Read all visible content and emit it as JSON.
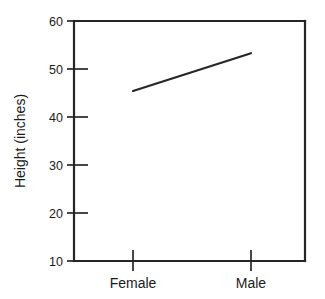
{
  "chart_data": {
    "type": "line",
    "title": "",
    "subtitle": "",
    "xlabel": "",
    "ylabel": "Height (inches)",
    "categories": [
      "Female",
      "Male"
    ],
    "series": [
      {
        "name": "Height",
        "values": [
          45.4,
          53.3
        ]
      }
    ],
    "ylim": [
      10,
      60
    ],
    "yticks": [
      10,
      20,
      30,
      40,
      50,
      60
    ],
    "ytick_labels": [
      "10",
      "20",
      "30",
      "40",
      "50",
      "60"
    ],
    "xtick_labels": [
      "Female",
      "Male"
    ],
    "grid": false,
    "legend": "none",
    "line_color": "#262626",
    "axis_color": "#262626",
    "background_color": "#ffffff",
    "annotations": []
  },
  "figure": {
    "name": "height-by-sex-line-plot",
    "y_axis_title": "Height (inches)",
    "y_ticks": [
      {
        "label": "60",
        "value": 60
      },
      {
        "label": "50",
        "value": 50
      },
      {
        "label": "40",
        "value": 40
      },
      {
        "label": "30",
        "value": 30
      },
      {
        "label": "20",
        "value": 20
      },
      {
        "label": "10",
        "value": 10
      }
    ],
    "x_ticks": [
      {
        "label": "Female",
        "value": 45.4
      },
      {
        "label": "Male",
        "value": 53.3
      }
    ]
  }
}
